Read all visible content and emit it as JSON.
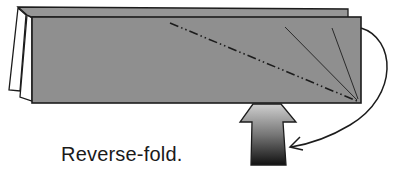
{
  "diagram": {
    "caption": "Reverse-fold.",
    "elements": [
      {
        "name": "folded-paper",
        "description": "folded paper strip with back layer and front layer"
      },
      {
        "name": "valley-fold-line",
        "style": "dash-dot",
        "description": "diagonal fold line from upper left to lower right corner"
      },
      {
        "name": "crease-lines",
        "count": 2,
        "description": "two thin lines fanning from lower right corner"
      },
      {
        "name": "push-arrow",
        "direction": "up",
        "description": "solid gradient arrow pushing upward"
      },
      {
        "name": "curved-motion-arrow",
        "description": "curved arrow from upper right corner looping to lower center"
      }
    ],
    "colors": {
      "paper": "#8f8f8f",
      "paper_back": "#999999",
      "outline": "#1c1c1c",
      "arrow_top": "#c8c8c8",
      "arrow_bottom": "#111111"
    }
  }
}
